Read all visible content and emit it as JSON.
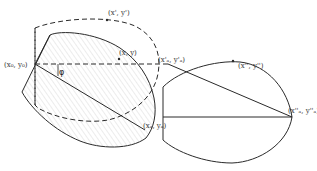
{
  "diagram": {
    "type": "geometric-transformation",
    "colors": {
      "stroke": "#2a2a2a",
      "hatch": "#c8c8c8",
      "background": "#ffffff"
    },
    "labels": {
      "origin": "(x₀, y₀)",
      "point": "(x, y)",
      "rotated_point": "(x', y')",
      "rotated_A": "(x'ₐ, y'ₐ)",
      "point_A": "(xₐ, yₐ)",
      "scaled_point": "(x'', y'')",
      "scaled_A": "(x''ₐ, y''ₐ)",
      "angle": "φ"
    },
    "shapes": [
      {
        "name": "original-shape",
        "style": "solid-hatched"
      },
      {
        "name": "rotated-shape",
        "style": "dashed"
      },
      {
        "name": "transformed-shape",
        "style": "solid"
      }
    ]
  }
}
